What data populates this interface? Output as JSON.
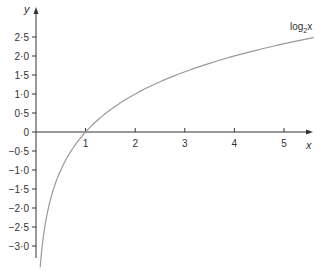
{
  "chart_data": {
    "type": "line",
    "title": "",
    "xlabel": "x",
    "ylabel": "y",
    "xlim": [
      0,
      5.6
    ],
    "ylim": [
      -3.5,
      2.9
    ],
    "grid": false,
    "legend": "none",
    "x_ticks": [
      "1",
      "2",
      "3",
      "4",
      "5"
    ],
    "y_ticks": [
      "2·5",
      "2·0",
      "1·5",
      "1·0",
      "0·5",
      "0",
      "−0·5",
      "−1·0",
      "−1·5",
      "−2·0",
      "−2·5",
      "−3·0"
    ],
    "series": [
      {
        "name": "log2x",
        "function": "log2(x)",
        "x": [
          0.09,
          0.125,
          0.25,
          0.5,
          1,
          2,
          3,
          4,
          5,
          5.6
        ],
        "values": [
          -3.47,
          -3.0,
          -2.0,
          -1.0,
          0,
          1.0,
          1.58,
          2.0,
          2.32,
          2.49
        ]
      }
    ],
    "annotations": [
      {
        "text": "log",
        "subscript": "2",
        "suffix": "x",
        "position": "upper-right near curve end"
      }
    ]
  },
  "labels": {
    "x_axis": "x",
    "y_axis": "y",
    "curve_base": "log",
    "curve_sub": "2",
    "curve_suffix": "x"
  },
  "colors": {
    "axis": "#333333",
    "curve": "#9a9a9a",
    "text": "#333333"
  }
}
